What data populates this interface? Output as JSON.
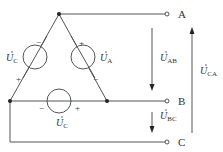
{
  "diagram": {
    "terminals": [
      {
        "id": "A",
        "label": "A"
      },
      {
        "id": "B",
        "label": "B"
      },
      {
        "id": "C",
        "label": "C"
      }
    ],
    "sources": [
      {
        "name": "U",
        "sub": "A",
        "plus": "+",
        "minus": "−"
      },
      {
        "name": "U",
        "sub": "C",
        "plus": "+",
        "minus": "−"
      },
      {
        "name": "U",
        "sub": "C",
        "plus": "+",
        "minus": "−"
      }
    ],
    "voltages": [
      {
        "name": "U",
        "sub": "AB"
      },
      {
        "name": "U",
        "sub": "BC"
      },
      {
        "name": "U",
        "sub": "CA"
      }
    ],
    "colors": {
      "line": "#555555",
      "text": "#333333",
      "background": "#ffffff"
    }
  }
}
